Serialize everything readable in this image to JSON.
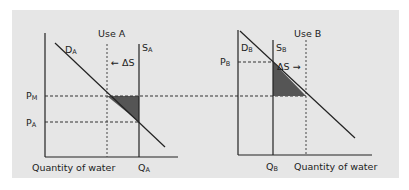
{
  "diagram": {
    "left_panel": {
      "title": "Use A",
      "demand_label": "D",
      "demand_sub": "A",
      "supply_label": "S",
      "supply_sub": "A",
      "shift_label": "← ΔS",
      "price_market_label": "P",
      "price_market_sub": "M",
      "price_label": "P",
      "price_sub": "A",
      "x_axis_label": "Quantity of water",
      "quantity_label": "Q",
      "quantity_sub": "A"
    },
    "right_panel": {
      "title": "Use B",
      "demand_label": "D",
      "demand_sub": "B",
      "supply_label": "S",
      "supply_sub": "B",
      "shift_label": "ΔS →",
      "price_label": "P",
      "price_sub": "B",
      "x_axis_label": "Quantity of water",
      "quantity_label": "Q",
      "quantity_sub": "B"
    },
    "colors": {
      "background": "#e6e6e6",
      "line": "#222222",
      "shaded_area": "#555555"
    }
  }
}
